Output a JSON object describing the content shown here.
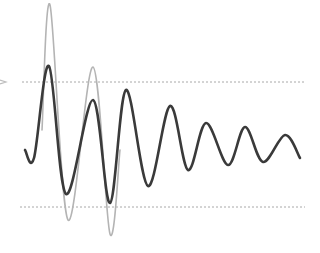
{
  "diagram": {
    "title": "",
    "colors": {
      "background": "#ffffff",
      "primary_wave": "#3a3a3a",
      "secondary_wave": "#b4b4b4",
      "reference_lines": "#a8a8a8",
      "marker": "#bdbdbd"
    },
    "reference_lines": [
      {
        "name": "upper-threshold",
        "y": 82,
        "x1": 22,
        "x2": 305
      },
      {
        "name": "lower-threshold",
        "y": 207,
        "x1": 20,
        "x2": 305
      }
    ],
    "marker": {
      "name": "threshold-arrow",
      "x": 0,
      "y": 82
    },
    "primary_wave": {
      "points": [
        [
          25,
          150
        ],
        [
          34,
          158
        ],
        [
          49,
          66
        ],
        [
          66,
          194
        ],
        [
          93,
          100
        ],
        [
          110,
          203
        ],
        [
          126,
          90
        ],
        [
          148,
          186
        ],
        [
          170,
          106
        ],
        [
          188,
          170
        ],
        [
          206,
          123
        ],
        [
          228,
          165
        ],
        [
          245,
          127
        ],
        [
          263,
          162
        ],
        [
          285,
          135
        ],
        [
          300,
          158
        ]
      ]
    },
    "secondary_wave": {
      "points": [
        [
          42,
          130
        ],
        [
          50,
          5
        ],
        [
          68,
          220
        ],
        [
          93,
          67
        ],
        [
          110,
          234
        ],
        [
          120,
          150
        ]
      ]
    }
  }
}
